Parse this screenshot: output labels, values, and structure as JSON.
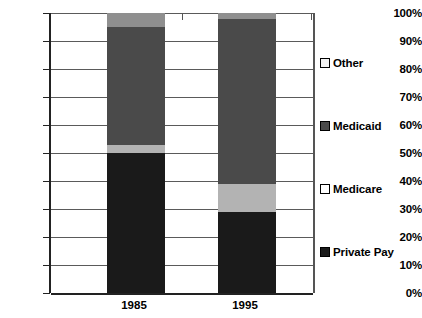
{
  "chart_data": {
    "type": "bar",
    "subtype": "stacked-100-percent",
    "title": "",
    "subtitle": "",
    "xlabel": "",
    "ylabel": "",
    "categories": [
      "1985",
      "1995"
    ],
    "ylim": [
      0,
      100
    ],
    "ytick_values": [
      0,
      10,
      20,
      30,
      40,
      50,
      60,
      70,
      80,
      90,
      100
    ],
    "ytick_labels": [
      "0%",
      "10%",
      "20%",
      "30%",
      "40%",
      "50%",
      "60%",
      "70%",
      "80%",
      "90%",
      "100%"
    ],
    "grid": true,
    "grid_axis": "y",
    "legend_position": "right",
    "stack_order_bottom_to_top": [
      "Private Pay",
      "Medicare",
      "Medicaid",
      "Other"
    ],
    "series": [
      {
        "name": "Private Pay",
        "values": [
          50,
          29
        ],
        "color": "#1a1a1a"
      },
      {
        "name": "Medicare",
        "values": [
          3,
          10
        ],
        "color": "#b3b3b3"
      },
      {
        "name": "Medicaid",
        "values": [
          42,
          59
        ],
        "color": "#4a4a4a"
      },
      {
        "name": "Other",
        "values": [
          5,
          2
        ],
        "color": "#8f8f8f"
      }
    ],
    "legend_entries": [
      {
        "label": "Other",
        "swatch_color": "#f2f2f2"
      },
      {
        "label": "Medicaid",
        "swatch_color": "#4a4a4a"
      },
      {
        "label": "Medicare",
        "swatch_color": "#ffffff"
      },
      {
        "label": "Private Pay",
        "swatch_color": "#1a1a1a"
      }
    ],
    "axis_color": "#333333",
    "gridline_color": "#5a5a5a",
    "background_color": "#ffffff"
  }
}
